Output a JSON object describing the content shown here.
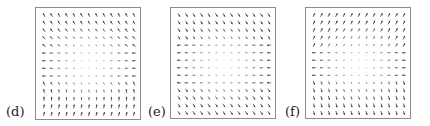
{
  "figure": {
    "panels": [
      {
        "id": "d",
        "label": "(d)",
        "frame": {
          "x": 35,
          "y": 7,
          "w": 106,
          "h": 113
        },
        "label_pos": {
          "x": 6,
          "y": 104
        },
        "grid": {
          "cols": 13,
          "rows": 14
        },
        "field": "d",
        "description": "Arrows point up-left in top rows, left through middle, up-right near bottom; faint near-zero center"
      },
      {
        "id": "e",
        "label": "(e)",
        "frame": {
          "x": 170,
          "y": 7,
          "w": 106,
          "h": 112
        },
        "label_pos": {
          "x": 148,
          "y": 104
        },
        "grid": {
          "cols": 13,
          "rows": 14
        },
        "field": "e",
        "description": "Arrows point down-right at top, left through middle, down-right at bottom; faint center"
      },
      {
        "id": "f",
        "label": "(f)",
        "frame": {
          "x": 305,
          "y": 7,
          "w": 106,
          "h": 112
        },
        "label_pos": {
          "x": 285,
          "y": 104
        },
        "grid": {
          "cols": 13,
          "rows": 14
        },
        "field": "f",
        "description": "Arrows point up-right at top, left through middle, down-left at bottom; faint center"
      }
    ],
    "colors": {
      "frame": "#8c8c8c",
      "arrow_strong": "#333333",
      "arrow_faint": "#d0d0d0",
      "label": "#222222"
    }
  }
}
